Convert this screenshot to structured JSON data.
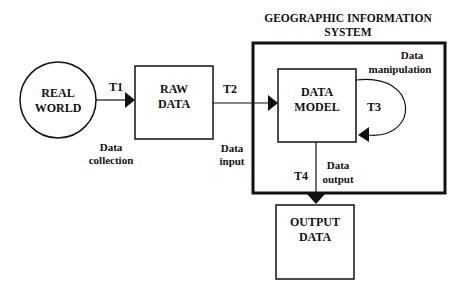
{
  "title": {
    "line1": "GEOGRAPHIC INFORMATION",
    "line2": "SYSTEM"
  },
  "nodes": {
    "real_world": {
      "line1": "REAL",
      "line2": "WORLD"
    },
    "raw_data": {
      "line1": "RAW",
      "line2": "DATA"
    },
    "data_model": {
      "line1": "DATA",
      "line2": "MODEL"
    },
    "output_data": {
      "line1": "OUTPUT",
      "line2": "DATA"
    }
  },
  "transitions": {
    "t1": {
      "id": "T1",
      "line1": "Data",
      "line2": "collection"
    },
    "t2": {
      "id": "T2",
      "line1": "Data",
      "line2": "input"
    },
    "t3": {
      "id": "T3",
      "line1": "Data",
      "line2": "manipulation"
    },
    "t4": {
      "id": "T4",
      "line1": "Data",
      "line2": "output"
    }
  },
  "colors": {
    "stroke": "#111111",
    "background": "#ffffff"
  }
}
